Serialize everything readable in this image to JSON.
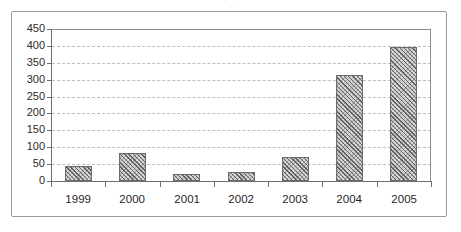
{
  "page": {
    "title_remnant": "(    )"
  },
  "chart_data": {
    "type": "bar",
    "title": "",
    "subtitle": "",
    "xlabel": "",
    "ylabel": "",
    "categories": [
      "1999",
      "2000",
      "2001",
      "2002",
      "2003",
      "2004",
      "2005"
    ],
    "values": [
      43,
      82,
      21,
      27,
      70,
      313,
      398
    ],
    "series": [
      {
        "name": "",
        "values": [
          43,
          82,
          21,
          27,
          70,
          313,
          398
        ]
      }
    ],
    "ylim": [
      0,
      450
    ],
    "ytick_values": [
      0,
      50,
      100,
      150,
      200,
      250,
      300,
      350,
      400,
      450
    ],
    "ytick_labels": [
      "0",
      "50",
      "100",
      "150",
      "200",
      "250",
      "300",
      "350",
      "400",
      "450"
    ],
    "grid": true,
    "grid_axis": "y",
    "grid_style": "dashed",
    "legend": false,
    "legend_position": "none",
    "bar_fill": "diagonal-hatch",
    "colors": {
      "bar_fill": "#d6d6d6",
      "bar_hatch": "#505050",
      "bar_border": "#6b6b6b",
      "gridline": "#bdbdbd",
      "axis": "#6e6e6e",
      "frame": "#9a9a9a",
      "text": "#1f1f1f",
      "background": "#ffffff"
    }
  }
}
